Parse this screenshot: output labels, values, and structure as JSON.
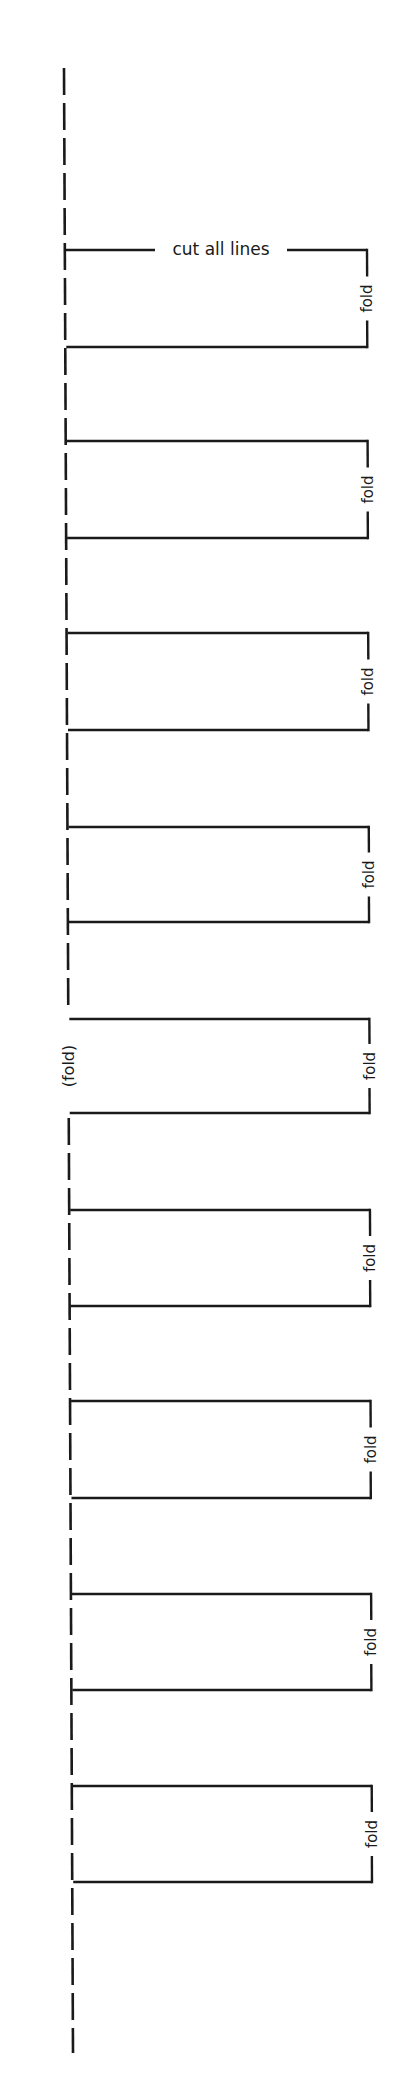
{
  "diagram": {
    "title_label": "cut all lines",
    "spine": {
      "style": "dashed",
      "label": "(fold)",
      "x_top": 64,
      "x_bottom": 73,
      "y_top": 68,
      "y_bottom": 2053
    },
    "colors": {
      "ink": "#1a1a1a",
      "background": "#ffffff"
    },
    "sections": [
      {
        "label": "fold",
        "top": 250,
        "bottom": 347
      },
      {
        "label": "fold",
        "top": 441,
        "bottom": 538
      },
      {
        "label": "fold",
        "top": 633,
        "bottom": 730
      },
      {
        "label": "fold",
        "top": 827,
        "bottom": 922
      },
      {
        "label": "fold",
        "top": 1019,
        "bottom": 1113
      },
      {
        "label": "fold",
        "top": 1210,
        "bottom": 1306
      },
      {
        "label": "fold",
        "top": 1401,
        "bottom": 1498
      },
      {
        "label": "fold",
        "top": 1594,
        "bottom": 1690
      },
      {
        "label": "fold",
        "top": 1786,
        "bottom": 1882
      }
    ]
  }
}
